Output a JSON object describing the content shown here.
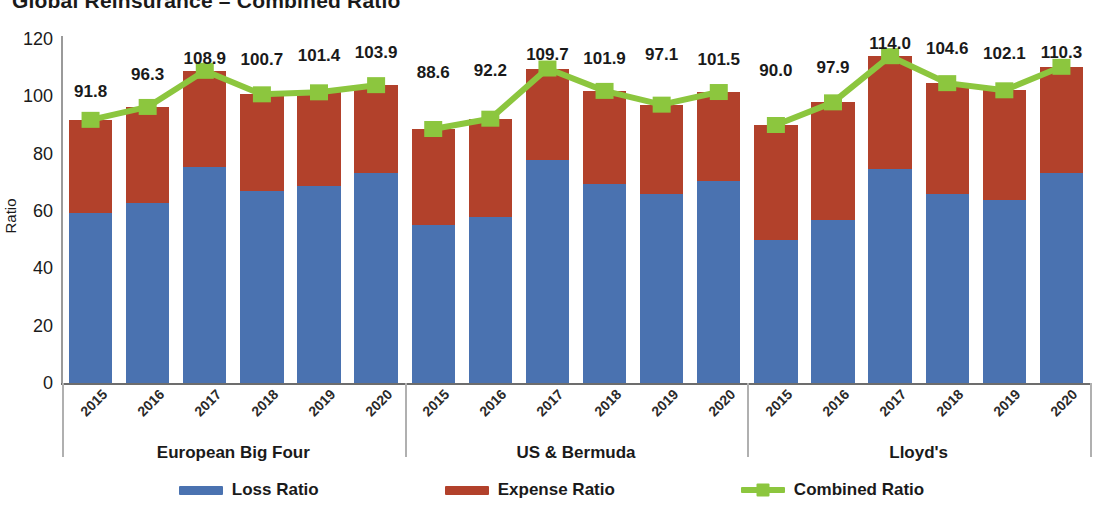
{
  "title": "Global Reinsurance – Combined Ratio",
  "colors": {
    "loss": "#4a72b0",
    "expense": "#b2412b",
    "combined": "#8cc63e",
    "axis": "#6d6d6d",
    "text": "#1a1a1a"
  },
  "legend": [
    {
      "label": "Loss Ratio",
      "color": "#4a72b0",
      "marker": "bar-swatch"
    },
    {
      "label": "Expense Ratio",
      "color": "#b2412b",
      "marker": "bar-swatch"
    },
    {
      "label": "Combined Ratio",
      "color": "#8cc63e",
      "marker": "line-square-swatch"
    }
  ],
  "chart_data": {
    "type": "bar",
    "title": "Global Reinsurance – Combined Ratio",
    "subtitle": "",
    "xlabel": "",
    "ylabel": "Ratio",
    "ylim": [
      0,
      120
    ],
    "yticks": [
      0,
      20,
      40,
      60,
      80,
      100,
      120
    ],
    "grid": false,
    "legend_position": "bottom",
    "stacked": true,
    "groups": [
      {
        "name": "European Big Four",
        "categories": [
          "2015",
          "2016",
          "2017",
          "2018",
          "2019",
          "2020"
        ],
        "series": [
          {
            "name": "Loss Ratio",
            "values": [
              59.3,
              62.8,
              75.5,
              67.0,
              68.8,
              73.2
            ]
          },
          {
            "name": "Expense Ratio",
            "values": [
              32.5,
              33.5,
              33.4,
              33.7,
              32.6,
              30.7
            ]
          },
          {
            "name": "Combined Ratio",
            "values": [
              91.8,
              96.3,
              108.9,
              100.7,
              101.4,
              103.9
            ]
          }
        ]
      },
      {
        "name": "US & Bermuda",
        "categories": [
          "2015",
          "2016",
          "2017",
          "2018",
          "2019",
          "2020"
        ],
        "series": [
          {
            "name": "Loss Ratio",
            "values": [
              55.0,
              57.8,
              77.7,
              69.5,
              65.8,
              70.5
            ]
          },
          {
            "name": "Expense Ratio",
            "values": [
              33.6,
              34.4,
              32.0,
              32.4,
              31.3,
              31.0
            ]
          },
          {
            "name": "Combined Ratio",
            "values": [
              88.6,
              92.2,
              109.7,
              101.9,
              97.1,
              101.5
            ]
          }
        ]
      },
      {
        "name": "Lloyd's",
        "categories": [
          "2015",
          "2016",
          "2017",
          "2018",
          "2019",
          "2020"
        ],
        "series": [
          {
            "name": "Loss Ratio",
            "values": [
              49.8,
              56.8,
              74.6,
              66.1,
              63.8,
              73.2
            ]
          },
          {
            "name": "Expense Ratio",
            "values": [
              40.2,
              41.1,
              39.4,
              38.5,
              38.3,
              37.1
            ]
          },
          {
            "name": "Combined Ratio",
            "values": [
              90.0,
              97.9,
              114.0,
              104.6,
              102.1,
              110.3
            ]
          }
        ]
      }
    ],
    "data_labels": [
      "91.8",
      "96.3",
      "108.9",
      "100.7",
      "101.4",
      "103.9",
      "88.6",
      "92.2",
      "109.7",
      "101.9",
      "97.1",
      "101.5",
      "90.0",
      "97.9",
      "114.0",
      "104.6",
      "102.1",
      "110.3"
    ]
  }
}
